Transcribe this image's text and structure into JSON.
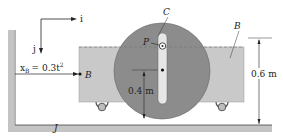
{
  "diagram": {
    "axes": {
      "i_label": "i",
      "j_label": "j"
    },
    "position_equation": {
      "lhs": "x",
      "subscript": "B",
      "rhs": "= 0.3t",
      "superscript": "2"
    },
    "labels": {
      "disk": "C",
      "cart_top": "B",
      "cart_point": "B",
      "pin": "P",
      "ground": "J",
      "radius_dim": "0.4 m",
      "height_dim": "0.6 m"
    },
    "colors": {
      "cart": "#c9c9c9",
      "disk": "#8c8c8c",
      "slot": "#e6e6e6",
      "wall": "#c4c4c4",
      "line": "#222222"
    }
  }
}
